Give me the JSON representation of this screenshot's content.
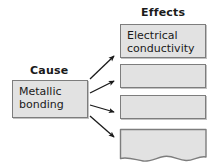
{
  "diagram": {
    "type": "cause-and-effect",
    "cause_heading": "Cause",
    "effects_heading": "Effects",
    "cause": {
      "label": "Metallic\nbonding"
    },
    "effects": [
      {
        "label": "Electrical\nconductivity",
        "empty": false
      },
      {
        "label": "",
        "empty": true
      },
      {
        "label": "",
        "empty": true
      },
      {
        "label": "",
        "empty": true,
        "torn_bottom": true
      }
    ],
    "arrows": [
      {
        "name": "arrow-to-effect-1",
        "direction": "up-right"
      },
      {
        "name": "arrow-to-effect-2",
        "direction": "up-right"
      },
      {
        "name": "arrow-to-effect-3",
        "direction": "down-right"
      },
      {
        "name": "arrow-to-effect-4",
        "direction": "down-right"
      }
    ],
    "colors": {
      "box_fill": "#e2e2e2",
      "box_border": "#7d7d7d",
      "text": "#1a1a1a",
      "arrow": "#1a1a1a",
      "background": "#ffffff"
    }
  }
}
